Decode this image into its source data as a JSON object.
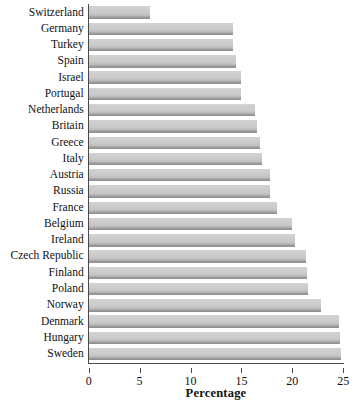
{
  "chart_data": {
    "type": "bar",
    "orientation": "horizontal",
    "title": "",
    "xlabel": "Percentage",
    "ylabel": "",
    "xlim": [
      0,
      25
    ],
    "xticks": [
      0,
      5,
      10,
      15,
      20,
      25
    ],
    "xtick_labels": [
      "0",
      "5",
      "10",
      "15",
      "20",
      "25"
    ],
    "grid": false,
    "legend": null,
    "bar_color": "#c9c9c9",
    "categories": [
      "Switzerland",
      "Germany",
      "Turkey",
      "Spain",
      "Israel",
      "Portugal",
      "Netherlands",
      "Britain",
      "Greece",
      "Italy",
      "Austria",
      "Russia",
      "France",
      "Belgium",
      "Ireland",
      "Czech Republic",
      "Finland",
      "Poland",
      "Norway",
      "Denmark",
      "Hungary",
      "Sweden"
    ],
    "values": [
      6.0,
      14.2,
      14.2,
      14.5,
      15.0,
      15.0,
      16.3,
      16.5,
      16.8,
      17.0,
      17.8,
      17.8,
      18.5,
      20.0,
      20.3,
      21.3,
      21.4,
      21.5,
      22.8,
      24.6,
      24.7,
      24.8
    ]
  }
}
